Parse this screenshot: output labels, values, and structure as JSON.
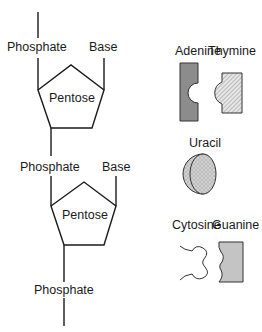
{
  "diagram": {
    "title": "",
    "nucleotide_1": {
      "phosphate_label": "Phosphate",
      "base_label": "Base",
      "sugar_label": "Pentose"
    },
    "nucleotide_2": {
      "phosphate_label": "Phosphate",
      "base_label": "Base",
      "sugar_label": "Pentose"
    },
    "bottom_phosphate_label": "Phosphate",
    "bases": [
      {
        "name": "Adenine",
        "fill": "#8c8c8c",
        "pattern": "solid",
        "shape": "concave-semicircle"
      },
      {
        "name": "Thymine",
        "fill": "#d9d9d9",
        "pattern": "diagonal-hatch",
        "shape": "convex-semicircle"
      },
      {
        "name": "Uracil",
        "fill": "#c8c8c8",
        "pattern": "circles",
        "shape": "convex-semicircle"
      },
      {
        "name": "Cytosine",
        "fill": "#ffffff",
        "pattern": "none",
        "shape": "bone-knob"
      },
      {
        "name": "Guanine",
        "fill": "#c4c4c4",
        "pattern": "solid",
        "shape": "concave-wavy"
      }
    ]
  }
}
